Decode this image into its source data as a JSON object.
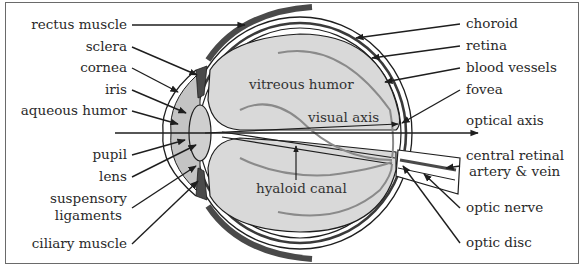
{
  "figure": {
    "colors": {
      "background": "#ffffff",
      "vitreous": "#d9d9d9",
      "aqueous": "#c4c4c4",
      "lens": "#cfcfcf",
      "muscle": "#4a4a4a",
      "outline": "#1e1e1e",
      "vessel_gray": "#8a8a8a",
      "frame": "#6a6a6a"
    }
  },
  "labels": {
    "left": [
      {
        "id": "rectus-muscle",
        "text": "rectus muscle"
      },
      {
        "id": "sclera",
        "text": "sclera"
      },
      {
        "id": "cornea",
        "text": "cornea"
      },
      {
        "id": "iris",
        "text": "iris"
      },
      {
        "id": "aqueous-humor",
        "text": "aqueous humor"
      },
      {
        "id": "pupil",
        "text": "pupil"
      },
      {
        "id": "lens",
        "text": "lens"
      },
      {
        "id": "suspensory-ligaments-1",
        "text": "suspensory"
      },
      {
        "id": "suspensory-ligaments-2",
        "text": "ligaments"
      },
      {
        "id": "ciliary-muscle",
        "text": "ciliary muscle"
      }
    ],
    "right": [
      {
        "id": "choroid",
        "text": "choroid"
      },
      {
        "id": "retina",
        "text": "retina"
      },
      {
        "id": "blood-vessels",
        "text": "blood vessels"
      },
      {
        "id": "fovea",
        "text": "fovea"
      },
      {
        "id": "optical-axis",
        "text": "optical axis"
      },
      {
        "id": "central-retinal-1",
        "text": "central retinal"
      },
      {
        "id": "central-retinal-2",
        "text": "artery & vein"
      },
      {
        "id": "optic-nerve",
        "text": "optic nerve"
      },
      {
        "id": "optic-disc",
        "text": "optic disc"
      }
    ],
    "inner": [
      {
        "id": "vitreous-humor",
        "text": "vitreous humor"
      },
      {
        "id": "visual-axis",
        "text": "visual axis"
      },
      {
        "id": "hyaloid-canal",
        "text": "hyaloid canal"
      }
    ]
  }
}
